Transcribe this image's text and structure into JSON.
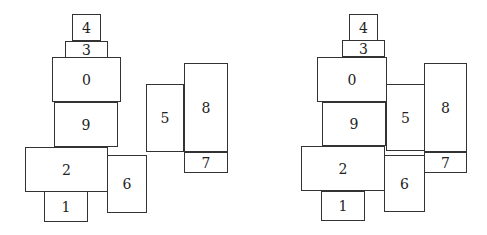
{
  "panels": [
    {
      "name": "left-layout",
      "boxes": [
        {
          "label": "4",
          "x": 72,
          "y": 14,
          "w": 29,
          "h": 27
        },
        {
          "label": "3",
          "x": 65,
          "y": 41,
          "w": 43,
          "h": 17
        },
        {
          "label": "0",
          "x": 52,
          "y": 57,
          "w": 69,
          "h": 45
        },
        {
          "label": "9",
          "x": 54,
          "y": 102,
          "w": 64,
          "h": 45
        },
        {
          "label": "2",
          "x": 25,
          "y": 147,
          "w": 83,
          "h": 45
        },
        {
          "label": "1",
          "x": 44,
          "y": 191,
          "w": 44,
          "h": 31
        },
        {
          "label": "6",
          "x": 107,
          "y": 155,
          "w": 40,
          "h": 58
        },
        {
          "label": "5",
          "x": 146,
          "y": 84,
          "w": 38,
          "h": 68
        },
        {
          "label": "8",
          "x": 184,
          "y": 63,
          "w": 44,
          "h": 89
        },
        {
          "label": "7",
          "x": 184,
          "y": 152,
          "w": 44,
          "h": 21
        }
      ]
    },
    {
      "name": "right-layout",
      "boxes": [
        {
          "label": "4",
          "x": 349,
          "y": 14,
          "w": 29,
          "h": 27
        },
        {
          "label": "3",
          "x": 342,
          "y": 40,
          "w": 43,
          "h": 17
        },
        {
          "label": "0",
          "x": 317,
          "y": 57,
          "w": 70,
          "h": 45
        },
        {
          "label": "9",
          "x": 322,
          "y": 102,
          "w": 64,
          "h": 44
        },
        {
          "label": "5",
          "x": 386,
          "y": 84,
          "w": 39,
          "h": 67
        },
        {
          "label": "8",
          "x": 424,
          "y": 63,
          "w": 43,
          "h": 89
        },
        {
          "label": "7",
          "x": 424,
          "y": 152,
          "w": 43,
          "h": 21
        },
        {
          "label": "2",
          "x": 301,
          "y": 146,
          "w": 84,
          "h": 45
        },
        {
          "label": "1",
          "x": 321,
          "y": 191,
          "w": 44,
          "h": 30
        },
        {
          "label": "6",
          "x": 384,
          "y": 155,
          "w": 41,
          "h": 57
        }
      ]
    }
  ]
}
